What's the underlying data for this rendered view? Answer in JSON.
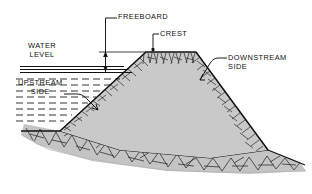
{
  "diagram": {
    "colors": {
      "fill_embankment": "#c9c9c9",
      "fill_foundation": "#c4c4c4",
      "line": "#101010",
      "background": "#ffffff",
      "hatch": "#2a2a2a"
    },
    "labels": {
      "freeboard": "FREEBOARD",
      "crest": "CREST",
      "downstream": "DOWNSTREAM\nSIDE",
      "water_level": "WATER\nLEVEL",
      "upstream": "UPSTREAM\nSIDE"
    },
    "annotations": {
      "freeboard_dimension": "vertical double-arrow between crest level and water level",
      "water_surface_lines": 3,
      "water_hatch_lines": 4
    }
  }
}
